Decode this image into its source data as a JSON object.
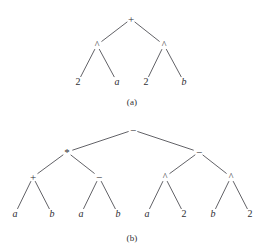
{
  "figure": {
    "background_color": "#ffffff",
    "line_color": "#3a3a40",
    "text_color": "#2e2e32",
    "width": 265,
    "height": 252
  },
  "panels": [
    {
      "id": "panel-a",
      "caption": "(a)",
      "caption_x": 132,
      "caption_y": 102,
      "expression": "2^a + 2^b",
      "nodes": [
        {
          "id": "a-root",
          "label": "+",
          "kind": "operator",
          "x": 131,
          "y": 19
        },
        {
          "id": "a-l",
          "label": "^",
          "kind": "operator",
          "x": 97,
          "y": 45
        },
        {
          "id": "a-r",
          "label": "^",
          "kind": "operator",
          "x": 164,
          "y": 45
        },
        {
          "id": "a-ll",
          "label": "2",
          "kind": "number",
          "x": 78,
          "y": 82
        },
        {
          "id": "a-lr",
          "label": "a",
          "kind": "variable",
          "x": 117,
          "y": 82
        },
        {
          "id": "a-rl",
          "label": "2",
          "kind": "number",
          "x": 146,
          "y": 82
        },
        {
          "id": "a-rr",
          "label": "b",
          "kind": "variable",
          "x": 184,
          "y": 82
        }
      ],
      "edges": [
        {
          "from": "a-root",
          "to": "a-l"
        },
        {
          "from": "a-root",
          "to": "a-r"
        },
        {
          "from": "a-l",
          "to": "a-ll"
        },
        {
          "from": "a-l",
          "to": "a-lr"
        },
        {
          "from": "a-r",
          "to": "a-rl"
        },
        {
          "from": "a-r",
          "to": "a-rr"
        }
      ]
    },
    {
      "id": "panel-b",
      "caption": "(b)",
      "caption_x": 132,
      "caption_y": 238,
      "expression": "(a+b)*(a-b) - (a^2 - b^2)",
      "nodes": [
        {
          "id": "b-root",
          "label": "−",
          "kind": "operator",
          "x": 133,
          "y": 130
        },
        {
          "id": "b-l",
          "label": "*",
          "kind": "operator",
          "x": 67,
          "y": 152
        },
        {
          "id": "b-r",
          "label": "−",
          "kind": "operator",
          "x": 199,
          "y": 152
        },
        {
          "id": "b-ll",
          "label": "+",
          "kind": "operator",
          "x": 33,
          "y": 177
        },
        {
          "id": "b-lr",
          "label": "−",
          "kind": "operator",
          "x": 99,
          "y": 177
        },
        {
          "id": "b-rl",
          "label": "^",
          "kind": "operator",
          "x": 165,
          "y": 177
        },
        {
          "id": "b-rr",
          "label": "^",
          "kind": "operator",
          "x": 231,
          "y": 177
        },
        {
          "id": "b-lll",
          "label": "a",
          "kind": "variable",
          "x": 15,
          "y": 214
        },
        {
          "id": "b-llr",
          "label": "b",
          "kind": "variable",
          "x": 52,
          "y": 214
        },
        {
          "id": "b-lrl",
          "label": "a",
          "kind": "variable",
          "x": 81,
          "y": 214
        },
        {
          "id": "b-lrr",
          "label": "b",
          "kind": "variable",
          "x": 118,
          "y": 214
        },
        {
          "id": "b-rll",
          "label": "a",
          "kind": "variable",
          "x": 147,
          "y": 214
        },
        {
          "id": "b-rlr",
          "label": "2",
          "kind": "number",
          "x": 184,
          "y": 214
        },
        {
          "id": "b-rrl",
          "label": "b",
          "kind": "variable",
          "x": 213,
          "y": 214
        },
        {
          "id": "b-rrr",
          "label": "2",
          "kind": "number",
          "x": 250,
          "y": 214
        }
      ],
      "edges": [
        {
          "from": "b-root",
          "to": "b-l"
        },
        {
          "from": "b-root",
          "to": "b-r"
        },
        {
          "from": "b-l",
          "to": "b-ll"
        },
        {
          "from": "b-l",
          "to": "b-lr"
        },
        {
          "from": "b-r",
          "to": "b-rl"
        },
        {
          "from": "b-r",
          "to": "b-rr"
        },
        {
          "from": "b-ll",
          "to": "b-lll"
        },
        {
          "from": "b-ll",
          "to": "b-llr"
        },
        {
          "from": "b-lr",
          "to": "b-lrl"
        },
        {
          "from": "b-lr",
          "to": "b-lrr"
        },
        {
          "from": "b-rl",
          "to": "b-rll"
        },
        {
          "from": "b-rl",
          "to": "b-rlr"
        },
        {
          "from": "b-rr",
          "to": "b-rrl"
        },
        {
          "from": "b-rr",
          "to": "b-rrr"
        }
      ]
    }
  ]
}
